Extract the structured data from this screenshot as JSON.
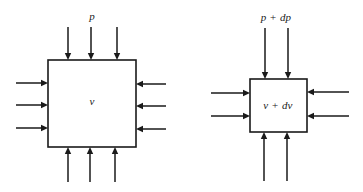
{
  "figure": {
    "background_color": "#ffffff",
    "line_color": "#1a1a1a",
    "width": 363,
    "height": 192
  },
  "diagrams": [
    {
      "id": "left",
      "name": "undisturbed-control-volume",
      "pressure_label": "p",
      "volume_label": "v",
      "box": {
        "x": 48,
        "y": 60,
        "width": 88,
        "height": 87
      },
      "arrows_per_side": 3,
      "arrow_direction": "inward",
      "pressure_label_pos": {
        "x": 92,
        "y": 16
      },
      "volume_label_pos": {
        "x": 92,
        "y": 101
      }
    },
    {
      "id": "right",
      "name": "perturbed-control-volume",
      "pressure_label": "p + dp",
      "volume_label": "v + dv",
      "box": {
        "x": 250,
        "y": 79,
        "width": 57,
        "height": 53
      },
      "arrows_per_side": 2,
      "arrow_direction": "inward",
      "pressure_label_pos": {
        "x": 276,
        "y": 17
      },
      "volume_label_pos": {
        "x": 278,
        "y": 105
      }
    }
  ],
  "arrows": {
    "left": {
      "top": [
        {
          "x": 68,
          "from_y": 27,
          "to_y": 60
        },
        {
          "x": 91,
          "from_y": 27,
          "to_y": 60
        },
        {
          "x": 117,
          "from_y": 27,
          "to_y": 60
        }
      ],
      "bottom": [
        {
          "x": 68,
          "from_y": 182,
          "to_y": 147
        },
        {
          "x": 90,
          "from_y": 182,
          "to_y": 147
        },
        {
          "x": 115,
          "from_y": 182,
          "to_y": 147
        }
      ],
      "left": [
        {
          "y": 83,
          "from_x": 16,
          "to_x": 48
        },
        {
          "y": 105,
          "from_x": 16,
          "to_x": 48
        },
        {
          "y": 128,
          "from_x": 16,
          "to_x": 48
        }
      ],
      "right": [
        {
          "y": 84,
          "from_x": 166,
          "to_x": 136
        },
        {
          "y": 106,
          "from_x": 166,
          "to_x": 136
        },
        {
          "y": 129,
          "from_x": 166,
          "to_x": 136
        }
      ]
    },
    "right": {
      "top": [
        {
          "x": 265,
          "from_y": 28,
          "to_y": 79
        },
        {
          "x": 288,
          "from_y": 28,
          "to_y": 79
        }
      ],
      "bottom": [
        {
          "x": 264,
          "from_y": 181,
          "to_y": 132
        },
        {
          "x": 287,
          "from_y": 181,
          "to_y": 132
        }
      ],
      "left": [
        {
          "y": 93,
          "from_x": 211,
          "to_x": 250
        },
        {
          "y": 116,
          "from_x": 211,
          "to_x": 250
        }
      ],
      "right": [
        {
          "y": 92,
          "from_x": 349,
          "to_x": 307
        },
        {
          "y": 116,
          "from_x": 349,
          "to_x": 307
        }
      ]
    }
  }
}
